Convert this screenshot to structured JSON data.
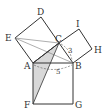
{
  "diagram": {
    "type": "geometry-figure",
    "colors": {
      "stroke": "#333333",
      "shade": "#d8d8d8",
      "thin": "#777777"
    },
    "points": {
      "A": {
        "label": "A",
        "x": 33,
        "y": 63
      },
      "B": {
        "label": "B",
        "x": 73,
        "y": 63
      },
      "C": {
        "label": "C",
        "x": 59,
        "y": 43
      },
      "D": {
        "label": "D",
        "x": 41,
        "y": 17
      },
      "E": {
        "label": "E",
        "x": 15,
        "y": 38
      },
      "F": {
        "label": "F",
        "x": 33,
        "y": 104
      },
      "G": {
        "label": "G",
        "x": 73,
        "y": 104
      },
      "H": {
        "label": "H",
        "x": 92,
        "y": 49
      },
      "I": {
        "label": "I",
        "x": 79,
        "y": 29
      }
    },
    "measurements": [
      {
        "segment": "BC",
        "value": "3"
      },
      {
        "segment": "AB",
        "value": "5"
      }
    ]
  }
}
